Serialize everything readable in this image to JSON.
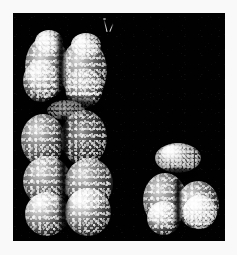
{
  "figure": {
    "kind": "electron-micrograph",
    "background_color": "#010101",
    "page_color": "#f9f9f9",
    "plate": {
      "x": 13,
      "y": 13,
      "width": 212,
      "height": 228
    },
    "caption": "",
    "label": "",
    "scale_bar": ""
  },
  "specimens": [
    {
      "id": "large-chromosome",
      "name": "large-chromosome",
      "description": "large submetacentric chromosome with two sister chromatids",
      "bounds": {
        "x": 24,
        "y": 18,
        "width": 88,
        "height": 215
      },
      "centromere_y": 105,
      "chromatids": 2,
      "arms": [
        "short-arm-left",
        "short-arm-right",
        "long-arm-left",
        "long-arm-right"
      ]
    },
    {
      "id": "small-chromosome",
      "name": "small-chromosome",
      "description": "small acrocentric chromosome",
      "bounds": {
        "x": 143,
        "y": 145,
        "width": 78,
        "height": 92
      },
      "centromere_y": 172,
      "chromatids": 2,
      "arms": [
        "short-arm",
        "long-arm-left",
        "long-arm-right"
      ]
    }
  ],
  "artifacts": [
    {
      "id": "filament",
      "name": "thread-artifact",
      "x": 100,
      "y": 16,
      "height": 14
    }
  ],
  "colors": {
    "background": "#010101",
    "page": "#f9f9f9",
    "chromatin_highlight": "#ffffff",
    "chromatin_mid": "#9a9a9a",
    "chromatin_shadow": "#2a2a2a"
  }
}
